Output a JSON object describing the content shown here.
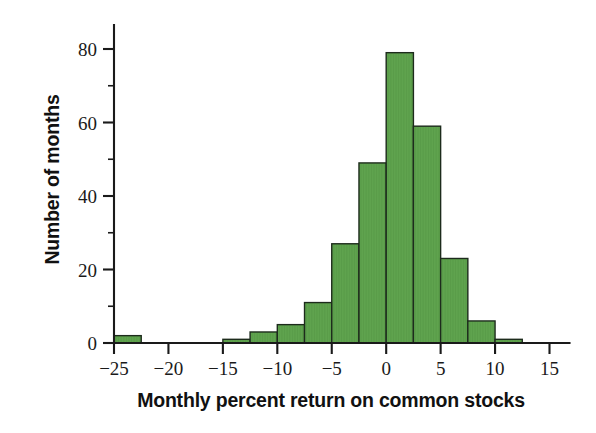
{
  "chart_data": {
    "type": "bar",
    "title": "",
    "subtitle": "",
    "xlabel": "Monthly percent return on common stocks",
    "ylabel": "Number of months",
    "xlim": [
      -27.5,
      16.5
    ],
    "ylim": [
      0,
      88
    ],
    "grid": false,
    "legend": null,
    "bin_width": 2.5,
    "xticks": [
      "−25",
      "−20",
      "−15",
      "−10",
      "−5",
      "0",
      "5",
      "10",
      "15"
    ],
    "xtick_values": [
      -25,
      -20,
      -15,
      -10,
      -5,
      0,
      5,
      10,
      15
    ],
    "xminor_tick_values": [
      -22.5,
      -17.5,
      -12.5,
      -7.5,
      -2.5,
      2.5,
      7.5,
      12.5
    ],
    "yticks": [
      "0",
      "20",
      "40",
      "60",
      "80"
    ],
    "ytick_values": [
      0,
      20,
      40,
      60,
      80
    ],
    "yminor_tick_values": [
      10,
      30,
      50,
      70
    ],
    "bar_color": "#5fa34e",
    "bar_edge_color": "#1d2b1c",
    "bins": [
      {
        "left": -25.0,
        "right": -22.5,
        "value": 2
      },
      {
        "left": -15.0,
        "right": -12.5,
        "value": 1
      },
      {
        "left": -12.5,
        "right": -10.0,
        "value": 3
      },
      {
        "left": -10.0,
        "right": -7.5,
        "value": 5
      },
      {
        "left": -7.5,
        "right": -5.0,
        "value": 11
      },
      {
        "left": -5.0,
        "right": -2.5,
        "value": 27
      },
      {
        "left": -2.5,
        "right": 0.0,
        "value": 49
      },
      {
        "left": 0.0,
        "right": 2.5,
        "value": 79
      },
      {
        "left": 2.5,
        "right": 5.0,
        "value": 59
      },
      {
        "left": 5.0,
        "right": 7.5,
        "value": 23
      },
      {
        "left": 7.5,
        "right": 10.0,
        "value": 6
      },
      {
        "left": 10.0,
        "right": 12.5,
        "value": 1
      }
    ],
    "categories": [
      "-25 to -22.5",
      "-15 to -12.5",
      "-12.5 to -10",
      "-10 to -7.5",
      "-7.5 to -5",
      "-5 to -2.5",
      "-2.5 to 0",
      "0 to 2.5",
      "2.5 to 5",
      "5 to 7.5",
      "7.5 to 10",
      "10 to 12.5"
    ],
    "values": [
      2,
      1,
      3,
      5,
      11,
      27,
      49,
      79,
      59,
      23,
      6,
      1
    ]
  }
}
